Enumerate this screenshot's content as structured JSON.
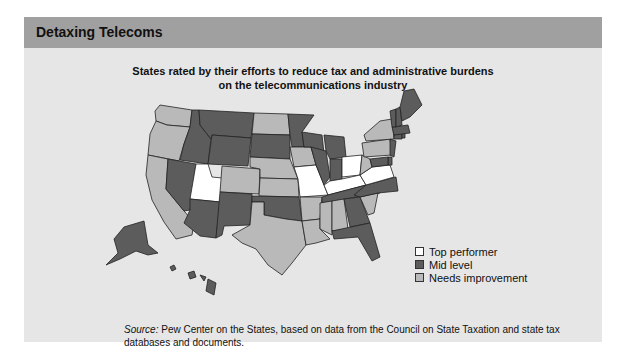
{
  "header": {
    "title": "Detaxing Telecoms"
  },
  "subtitle": {
    "line1": "States rated by their efforts to reduce tax and administrative burdens",
    "line2": "on the telecommunications industry"
  },
  "legend": {
    "items": [
      {
        "key": "top",
        "label": "Top performer",
        "color": "#ffffff"
      },
      {
        "key": "mid",
        "label": "Mid level",
        "color": "#5c5c5c"
      },
      {
        "key": "needs",
        "label": "Needs improvement",
        "color": "#b9b9b9"
      }
    ]
  },
  "states": {
    "top": [
      "UT",
      "MO",
      "OH",
      "KY",
      "VA"
    ],
    "mid": [
      "MT",
      "ID",
      "WY",
      "NV",
      "AZ",
      "NM",
      "SD",
      "MN",
      "WI",
      "MI",
      "IL",
      "IN",
      "OK",
      "TN",
      "GA",
      "FL",
      "NC",
      "VT",
      "NH",
      "ME",
      "MA",
      "RI",
      "CT",
      "NJ",
      "DE",
      "MD",
      "AK",
      "HI"
    ],
    "needs": [
      "WA",
      "OR",
      "CA",
      "ND",
      "NE",
      "CO",
      "KS",
      "IA",
      "TX",
      "AR",
      "LA",
      "MS",
      "AL",
      "SC",
      "NY",
      "PA",
      "WV"
    ]
  },
  "source": {
    "label": "Source:",
    "text": " Pew Center on the States, based on data from the Council on State Taxation and state tax databases and documents."
  }
}
